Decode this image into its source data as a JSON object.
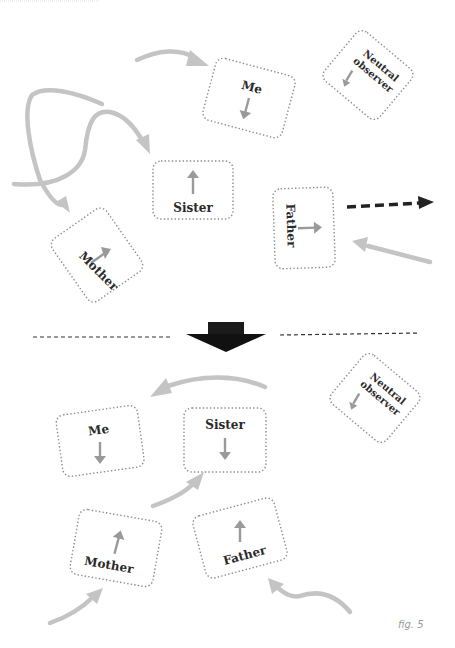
{
  "figure": {
    "label": "fig. 5",
    "colors": {
      "box_border": "#8c8c8c",
      "flow_arrow": "#c4c4c4",
      "inner_arrow": "#9a9a9a",
      "emphasis_arrow": "#222222",
      "divider": "#333333",
      "text": "#2a2a2a"
    }
  },
  "top_panel": {
    "nodes": [
      {
        "id": "me",
        "label": "Me",
        "inner_arrow": "down"
      },
      {
        "id": "neutral",
        "label_line1": "Neutral",
        "label_line2": "observer",
        "inner_arrow": "down-left"
      },
      {
        "id": "sister",
        "label": "Sister",
        "inner_arrow": "up"
      },
      {
        "id": "mother",
        "label": "Mother",
        "inner_arrow": "up-right"
      },
      {
        "id": "father",
        "label": "Father",
        "inner_arrow": "right"
      }
    ],
    "external_arrows": [
      {
        "id": "curve-into-me",
        "style": "grey-curved",
        "target": "me"
      },
      {
        "id": "loop-into-sister",
        "style": "grey-curved",
        "target": "sister"
      },
      {
        "id": "loop-into-mother",
        "style": "grey-curved",
        "target": "mother"
      },
      {
        "id": "dashed-out-from-father",
        "style": "black-dashed",
        "direction": "right"
      },
      {
        "id": "straight-into-father",
        "style": "grey-straight",
        "target": "father"
      }
    ]
  },
  "transition": {
    "arrow": "down",
    "style": "black-block"
  },
  "bottom_panel": {
    "nodes": [
      {
        "id": "me",
        "label": "Me",
        "inner_arrow": "down"
      },
      {
        "id": "sister",
        "label": "Sister",
        "inner_arrow": "down"
      },
      {
        "id": "neutral",
        "label_line1": "Neutral",
        "label_line2": "observer",
        "inner_arrow": "down-left"
      },
      {
        "id": "mother",
        "label": "Mother",
        "inner_arrow": "up"
      },
      {
        "id": "father",
        "label": "Father",
        "inner_arrow": "up"
      }
    ],
    "external_arrows": [
      {
        "id": "arc-toward-me",
        "style": "grey-curved",
        "direction": "left"
      },
      {
        "id": "curve-into-sister",
        "style": "grey-curved",
        "target": "sister"
      },
      {
        "id": "curve-into-mother",
        "style": "grey-curved",
        "target": "mother"
      },
      {
        "id": "curve-into-father",
        "style": "grey-curved",
        "target": "father"
      }
    ]
  }
}
